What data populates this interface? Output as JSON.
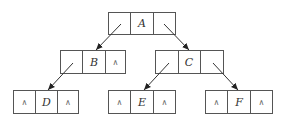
{
  "diagram": {
    "null_symbol": "∧",
    "nodes": [
      {
        "id": "A",
        "label": "A",
        "left": "B",
        "right": "C",
        "left_text": "",
        "right_text": ""
      },
      {
        "id": "B",
        "label": "B",
        "left": "D",
        "right": null,
        "left_text": "",
        "right_text": "∧"
      },
      {
        "id": "C",
        "label": "C",
        "left": "E",
        "right": "F",
        "left_text": "",
        "right_text": ""
      },
      {
        "id": "D",
        "label": "D",
        "left": null,
        "right": null,
        "left_text": "∧",
        "right_text": "∧"
      },
      {
        "id": "E",
        "label": "E",
        "left": null,
        "right": null,
        "left_text": "∧",
        "right_text": "∧"
      },
      {
        "id": "F",
        "label": "F",
        "left": null,
        "right": null,
        "left_text": "∧",
        "right_text": "∧"
      }
    ],
    "edges": [
      {
        "from": "A",
        "side": "left",
        "to": "B"
      },
      {
        "from": "A",
        "side": "right",
        "to": "C"
      },
      {
        "from": "B",
        "side": "left",
        "to": "D"
      },
      {
        "from": "C",
        "side": "left",
        "to": "E"
      },
      {
        "from": "C",
        "side": "right",
        "to": "F"
      }
    ]
  }
}
